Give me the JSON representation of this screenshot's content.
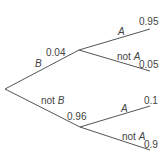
{
  "diagram": {
    "type": "probability-tree",
    "colors": {
      "line": "#555555",
      "text": "#444444",
      "background": "#ffffff"
    },
    "first_level": [
      {
        "event_prefix": "",
        "event_letter": "B",
        "probability": "0.04"
      },
      {
        "event_prefix": "not ",
        "event_letter": "B",
        "probability": "0.96"
      }
    ],
    "second_level": {
      "given_B": [
        {
          "event_prefix": "",
          "event_letter": "A",
          "probability": "0.95"
        },
        {
          "event_prefix": "not ",
          "event_letter": "A",
          "probability": "0.05"
        }
      ],
      "given_not_B": [
        {
          "event_prefix": "",
          "event_letter": "A",
          "probability": "0.1"
        },
        {
          "event_prefix": "not ",
          "event_letter": "A",
          "probability": "0.9"
        }
      ]
    }
  }
}
